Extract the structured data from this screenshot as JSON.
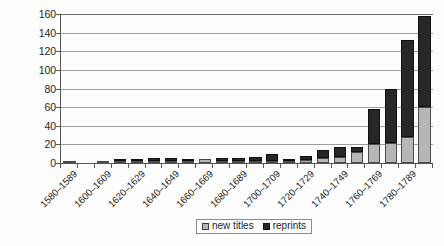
{
  "chart_data": {
    "type": "bar",
    "stacked": true,
    "title": "",
    "subtitle": "",
    "xlabel": "",
    "ylabel": "",
    "ylim": [
      0,
      160
    ],
    "ytick_step": 20,
    "ytick_labels": [
      "160",
      "140",
      "120",
      "100",
      "80",
      "60",
      "40",
      "20",
      "0"
    ],
    "ytick_values": [
      160,
      140,
      120,
      100,
      80,
      60,
      40,
      20,
      0
    ],
    "grid": true,
    "grid_axis": "y",
    "legend_position": "bottom-center",
    "categories": [
      "1580–1589",
      "1590–1599",
      "1600–1609",
      "1610–1619",
      "1620–1629",
      "1630–1639",
      "1640–1649",
      "1650–1659",
      "1660–1669",
      "1670–1679",
      "1680–1689",
      "1690–1699",
      "1700–1709",
      "1710–1719",
      "1720–1729",
      "1730–1739",
      "1740–1749",
      "1750–1759",
      "1760–1769",
      "1770–1779",
      "1780–1789",
      "1790–1799"
    ],
    "visible_tick_labels": [
      "1580–1589",
      "1600–1609",
      "1620–1629",
      "1640–1649",
      "1660–1669",
      "1680–1689",
      "1700–1709",
      "1720–1729",
      "1740–1749",
      "1760–1769",
      "1780–1789"
    ],
    "visible_tick_indices": [
      0,
      2,
      4,
      6,
      8,
      10,
      12,
      14,
      16,
      18,
      20
    ],
    "series": [
      {
        "name": "new titles",
        "color": "#b6b6b6",
        "values": [
          1,
          0,
          1,
          1,
          1,
          1,
          1,
          1,
          4,
          1,
          1,
          2,
          2,
          1,
          3,
          5,
          6,
          12,
          20,
          22,
          28,
          60
        ]
      },
      {
        "name": "reprints",
        "color": "#272727",
        "values": [
          0,
          0,
          0,
          1,
          2,
          3,
          3,
          2,
          0,
          3,
          3,
          4,
          8,
          2,
          5,
          9,
          11,
          5,
          38,
          58,
          104,
          98
        ]
      }
    ],
    "totals": [
      1,
      0,
      1,
      2,
      3,
      4,
      4,
      3,
      4,
      4,
      4,
      6,
      10,
      3,
      8,
      14,
      17,
      17,
      58,
      80,
      132,
      158
    ]
  },
  "legend": {
    "items": [
      {
        "label": "new titles",
        "swatch": "new"
      },
      {
        "label": "reprints",
        "swatch": "reprints"
      }
    ]
  }
}
